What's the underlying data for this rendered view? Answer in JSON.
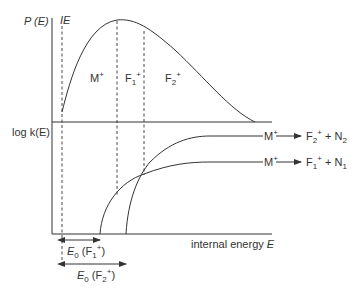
{
  "diagram": {
    "y_axis_top_label": "P (E)",
    "y_axis_bottom_label": "log k(E)",
    "x_axis_label_text": "internal energy ",
    "x_axis_label_var": "E",
    "ionization_label": "IE",
    "regions": {
      "m": "M",
      "f1": "F",
      "f2": "F"
    },
    "reactions": [
      {
        "reactant": "M",
        "product": "F",
        "product_sub": "2",
        "neutral": "N",
        "neutral_sub": "2"
      },
      {
        "reactant": "M",
        "product": "F",
        "product_sub": "1",
        "neutral": "N",
        "neutral_sub": "1"
      }
    ],
    "thresholds": [
      {
        "symbol": "E",
        "sub": "0",
        "species": "F",
        "species_sub": "1"
      },
      {
        "symbol": "E",
        "sub": "0",
        "species": "F",
        "species_sub": "2"
      }
    ],
    "plus": "+",
    "colors": {
      "line": "#333333",
      "background": "#ffffff"
    }
  }
}
